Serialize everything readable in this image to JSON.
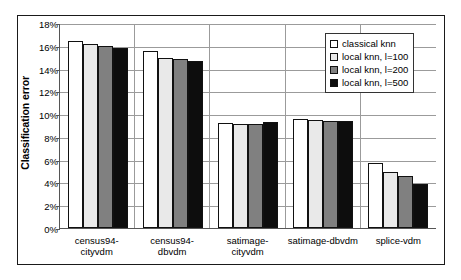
{
  "chart_data": {
    "type": "bar",
    "title": "",
    "xlabel": "",
    "ylabel": "Classification error",
    "ylim": [
      0,
      18
    ],
    "ytick_labels": [
      "18%",
      "16%",
      "14%",
      "12%",
      "10%",
      "8%",
      "6%",
      "4%",
      "2%",
      "0%"
    ],
    "ytick_values": [
      18,
      16,
      14,
      12,
      10,
      8,
      6,
      4,
      2,
      0
    ],
    "grid": true,
    "legend_position": "top-right",
    "categories": [
      "census94-cityvdm",
      "census94-dbvdm",
      "satimage-cityvdm",
      "satimage-dbvdm",
      "splice-vdm"
    ],
    "category_lines": [
      [
        "census94-",
        "cityvdm"
      ],
      [
        "census94-",
        "dbvdm"
      ],
      [
        "satimage-",
        "cityvdm"
      ],
      [
        "satimage-dbvdm"
      ],
      [
        "splice-vdm"
      ]
    ],
    "series": [
      {
        "name": "classical knn",
        "color": "#ffffff",
        "values": [
          16.4,
          15.55,
          9.2,
          9.6,
          5.7
        ]
      },
      {
        "name": "local knn, l=100",
        "color": "#e9e9e9",
        "values": [
          16.2,
          14.9,
          9.1,
          9.5,
          4.9
        ]
      },
      {
        "name": "local knn, l=200",
        "color": "#808080",
        "values": [
          16.0,
          14.85,
          9.1,
          9.4,
          4.6
        ]
      },
      {
        "name": "local knn, l=500",
        "color": "#0d0d0d",
        "values": [
          15.8,
          14.7,
          9.3,
          9.4,
          3.9
        ]
      }
    ]
  }
}
